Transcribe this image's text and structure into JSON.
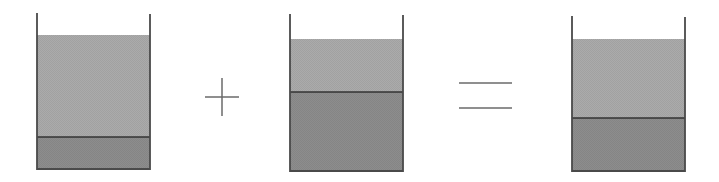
{
  "diagram": {
    "colors": {
      "background": "#ffffff",
      "wall": "#4a4a4a",
      "upper_layer": "#ababab",
      "lower_layer": "#8d8d8d",
      "interface": "#333333",
      "operator": "#6a6a6a"
    },
    "beakers": [
      {
        "id": "beaker-a",
        "left": 37,
        "right": 150,
        "wall_top": 13,
        "fill_top": 35,
        "interface": 137,
        "bottom": 169
      },
      {
        "id": "beaker-b",
        "left": 290,
        "right": 403,
        "wall_top": 14,
        "fill_top": 39,
        "interface": 92,
        "bottom": 171
      },
      {
        "id": "beaker-c",
        "left": 572,
        "right": 685,
        "wall_top": 16,
        "fill_top": 39,
        "interface": 118,
        "bottom": 171
      }
    ],
    "operators": [
      {
        "id": "plus",
        "symbol": "+",
        "cx": 222,
        "cy": 97,
        "half": 17
      },
      {
        "id": "equals",
        "symbol": "=",
        "x1": 459,
        "x2": 512,
        "y1": 83,
        "y2": 108
      }
    ]
  }
}
